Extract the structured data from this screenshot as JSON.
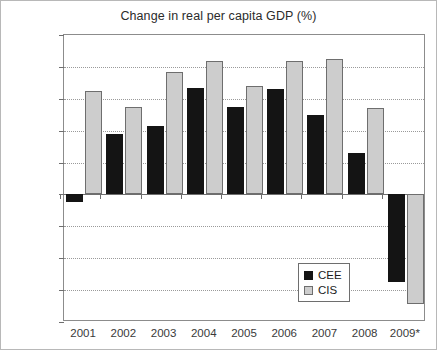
{
  "chart_data": {
    "type": "bar",
    "title": "Change in real per capita GDP (%)",
    "xlabel": "",
    "ylabel": "",
    "ylim": [
      -8,
      10
    ],
    "ytick_step": 2,
    "yticks": [
      10,
      8,
      6,
      4,
      2,
      0,
      -2,
      -4,
      -6,
      -8
    ],
    "ytick_labels": [
      "10",
      "8",
      "6",
      "4",
      "2",
      "0",
      "−2",
      "−4",
      "−6",
      "−8"
    ],
    "grid": true,
    "grid_axis": "y",
    "legend_position": "bottom-right",
    "categories": [
      "2001",
      "2002",
      "2003",
      "2004",
      "2005",
      "2006",
      "2007",
      "2008",
      "2009*"
    ],
    "series": [
      {
        "name": "CEE",
        "color": "#141414",
        "values": [
          -0.5,
          3.8,
          4.3,
          6.7,
          5.5,
          6.6,
          5.0,
          2.6,
          -5.5
        ]
      },
      {
        "name": "CIS",
        "color": "#cdcdcd",
        "values": [
          6.5,
          5.5,
          7.7,
          8.4,
          6.8,
          8.4,
          8.5,
          5.4,
          -6.9
        ]
      }
    ]
  },
  "legend": {
    "entries": [
      {
        "label": "CEE"
      },
      {
        "label": "CIS"
      }
    ]
  }
}
